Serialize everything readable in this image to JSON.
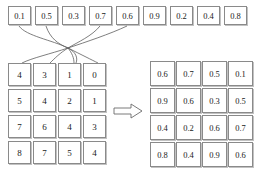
{
  "figure": {
    "title": "",
    "top_row": {
      "name": "input-value-sequence",
      "values": [
        "0.1",
        "0.5",
        "0.3",
        "0.7",
        "0.6",
        "0.9",
        "0.2",
        "0.4",
        "0.8"
      ]
    },
    "left_matrix": {
      "name": "index-matrix",
      "rows": [
        [
          "4",
          "3",
          "1",
          "0"
        ],
        [
          "5",
          "4",
          "2",
          "1"
        ],
        [
          "7",
          "6",
          "4",
          "3"
        ],
        [
          "8",
          "7",
          "5",
          "4"
        ]
      ]
    },
    "right_matrix": {
      "name": "gathered-value-matrix",
      "rows": [
        [
          "0.6",
          "0.7",
          "0.5",
          "0.1"
        ],
        [
          "0.9",
          "0.6",
          "0.3",
          "0.5"
        ],
        [
          "0.4",
          "0.2",
          "0.6",
          "0.7"
        ],
        [
          "0.8",
          "0.4",
          "0.9",
          "0.6"
        ]
      ]
    },
    "arrow": {
      "name": "transform-arrow",
      "label": ""
    },
    "colors": {
      "border": "#8a8a8a",
      "text": "#1a1a1a",
      "link": "#5e5e5e",
      "background": "#ffffff"
    }
  }
}
